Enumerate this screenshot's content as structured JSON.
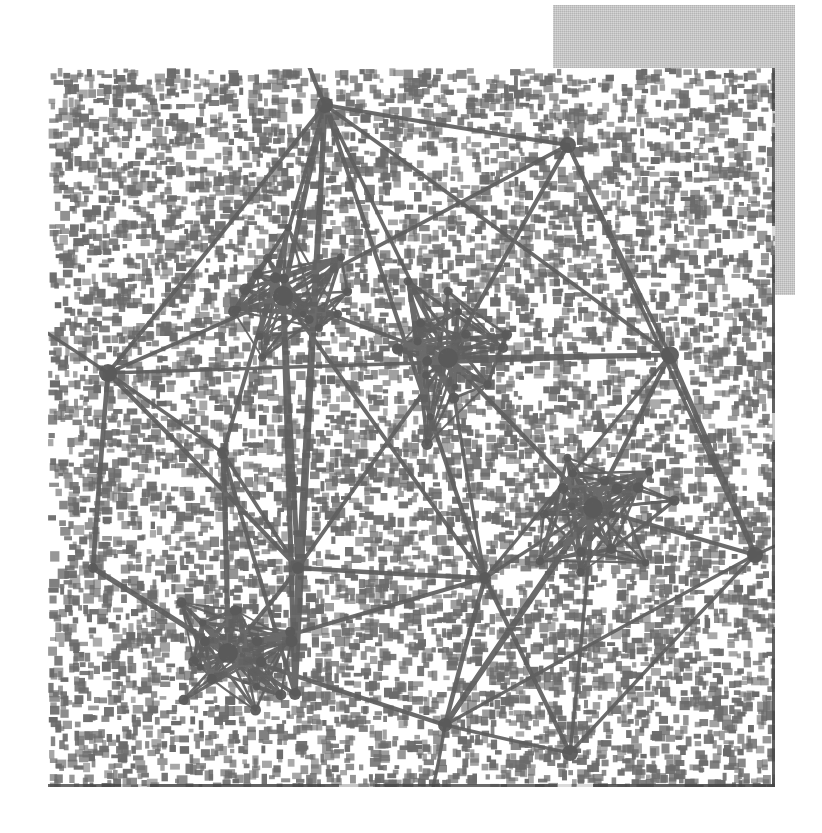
{
  "page": {
    "width": 822,
    "height": 833,
    "background_color": "#ffffff"
  },
  "backdrop_panel": {
    "name": "gray-panel",
    "x": 553,
    "y": 5,
    "width": 242,
    "height": 290,
    "color": "#c9c9c9"
  },
  "figure_plate": {
    "name": "scanned-figure-plate",
    "x": 48,
    "y": 68,
    "width": 727,
    "height": 719,
    "background_color": "#ffffff",
    "ink_color": "#5f5f5f",
    "edge_shadow_color": "#464646"
  },
  "chart_data": {
    "type": "scatter",
    "title": "",
    "subtitle": "",
    "xlabel": "",
    "ylabel": "",
    "grid": false,
    "legend": false,
    "axis_visible": false,
    "xlim": [
      0,
      727
    ],
    "ylim": [
      0,
      719
    ],
    "render": {
      "node_color": "#5a5a5a",
      "edge_color": "#5f5f5f",
      "hub_edge_width": 4.2,
      "cluster_edge_width": 2.6,
      "background_noise_color": "#6b6b6b",
      "background_noise_density": 0.34
    },
    "nodes": [
      {
        "id": "h0",
        "x": 277,
        "y": 37,
        "r": 8,
        "group": "hub"
      },
      {
        "id": "h1",
        "x": 520,
        "y": 77,
        "r": 8,
        "group": "hub"
      },
      {
        "id": "h2",
        "x": 622,
        "y": 287,
        "r": 9,
        "group": "hub"
      },
      {
        "id": "h3",
        "x": 707,
        "y": 487,
        "r": 8,
        "group": "hub"
      },
      {
        "id": "h4",
        "x": 60,
        "y": 305,
        "r": 9,
        "group": "hub"
      },
      {
        "id": "h5",
        "x": 175,
        "y": 385,
        "r": 6,
        "group": "hub"
      },
      {
        "id": "h6",
        "x": 45,
        "y": 500,
        "r": 5,
        "group": "hub"
      },
      {
        "id": "h7",
        "x": 397,
        "y": 657,
        "r": 7,
        "group": "hub"
      },
      {
        "id": "h8",
        "x": 522,
        "y": 685,
        "r": 8,
        "group": "hub"
      },
      {
        "id": "h9",
        "x": 437,
        "y": 510,
        "r": 6,
        "group": "hub"
      },
      {
        "id": "h10",
        "x": 250,
        "y": 500,
        "r": 6,
        "group": "hub"
      },
      {
        "id": "h11",
        "x": 247,
        "y": 626,
        "r": 6,
        "group": "hub"
      },
      {
        "id": "c1c",
        "x": 235,
        "y": 228,
        "r": 10,
        "group": "cluster-upper-left"
      },
      {
        "id": "c2c",
        "x": 400,
        "y": 290,
        "r": 10,
        "group": "cluster-center"
      },
      {
        "id": "c3c",
        "x": 545,
        "y": 440,
        "r": 10,
        "group": "cluster-right"
      },
      {
        "id": "c4c",
        "x": 180,
        "y": 585,
        "r": 10,
        "group": "cluster-bottom-left"
      }
    ],
    "clusters": [
      {
        "name": "cluster-upper-left",
        "cx": 235,
        "cy": 228,
        "rx": 78,
        "ry": 62,
        "members": 16
      },
      {
        "name": "cluster-center",
        "cx": 400,
        "cy": 290,
        "rx": 62,
        "ry": 76,
        "members": 16
      },
      {
        "name": "cluster-right",
        "cx": 545,
        "cy": 440,
        "rx": 70,
        "ry": 62,
        "members": 16
      },
      {
        "name": "cluster-bottom-left",
        "cx": 180,
        "cy": 585,
        "rx": 72,
        "ry": 56,
        "members": 16
      }
    ],
    "hub_edges": [
      [
        "h0",
        "h1"
      ],
      [
        "h0",
        "h2"
      ],
      [
        "h0",
        "h4"
      ],
      [
        "h0",
        "h5"
      ],
      [
        "h0",
        "h9"
      ],
      [
        "h0",
        "c1c"
      ],
      [
        "h0",
        "c2c"
      ],
      [
        "h0",
        "h10"
      ],
      [
        "h0",
        "h11"
      ],
      [
        "h1",
        "h2"
      ],
      [
        "h1",
        "c2c"
      ],
      [
        "h1",
        "c1c"
      ],
      [
        "h1",
        "h3"
      ],
      [
        "h2",
        "h3"
      ],
      [
        "h2",
        "c2c"
      ],
      [
        "h2",
        "c3c"
      ],
      [
        "h2",
        "h4"
      ],
      [
        "h2",
        "h9"
      ],
      [
        "h3",
        "h8"
      ],
      [
        "h3",
        "c3c"
      ],
      [
        "h3",
        "h7"
      ],
      [
        "h4",
        "h5"
      ],
      [
        "h4",
        "c1c"
      ],
      [
        "h4",
        "h10"
      ],
      [
        "h4",
        "h6"
      ],
      [
        "h5",
        "h10"
      ],
      [
        "h5",
        "h11"
      ],
      [
        "h5",
        "c4c"
      ],
      [
        "h6",
        "c4c"
      ],
      [
        "h6",
        "h11"
      ],
      [
        "h7",
        "h8"
      ],
      [
        "h7",
        "c4c"
      ],
      [
        "h7",
        "h9"
      ],
      [
        "h7",
        "c3c"
      ],
      [
        "h8",
        "c3c"
      ],
      [
        "h8",
        "h9"
      ],
      [
        "h9",
        "c2c"
      ],
      [
        "h9",
        "c3c"
      ],
      [
        "h9",
        "h10"
      ],
      [
        "h9",
        "c4c"
      ],
      [
        "h10",
        "c1c"
      ],
      [
        "h10",
        "c2c"
      ],
      [
        "h10",
        "c4c"
      ],
      [
        "h10",
        "h11"
      ],
      [
        "h11",
        "c4c"
      ],
      [
        "h11",
        "c1c"
      ],
      [
        "c1c",
        "c2c"
      ],
      [
        "c2c",
        "c3c"
      ],
      [
        "c1c",
        "h9"
      ],
      [
        "c3c",
        "h7"
      ]
    ]
  }
}
